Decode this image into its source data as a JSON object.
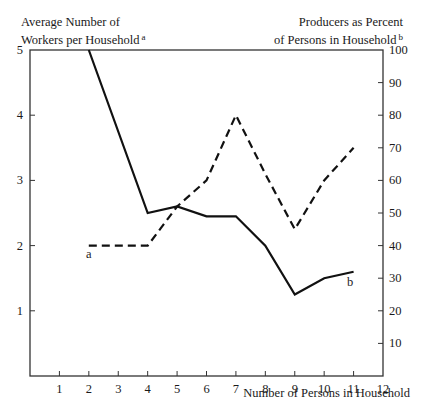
{
  "chart_data": {
    "type": "line",
    "title": "",
    "xlabel": "Number of Persons in Household",
    "ylabel_left": "Average Number of Workers per Household",
    "ylabel_left_footnote": "a",
    "ylabel_right": "Producers as Percent of Persons in Household",
    "ylabel_right_footnote": "b",
    "x_ticks": [
      1,
      2,
      3,
      4,
      5,
      6,
      7,
      8,
      9,
      10,
      11,
      12
    ],
    "y_left_ticks": [
      1,
      2,
      3,
      4,
      5
    ],
    "y_right_ticks": [
      10,
      20,
      30,
      40,
      50,
      60,
      70,
      80,
      90,
      100
    ],
    "xlim": [
      0,
      12
    ],
    "ylim_left": [
      0,
      5
    ],
    "ylim_right": [
      0,
      100
    ],
    "grid": false,
    "legend": "inline labels",
    "series": [
      {
        "name": "a",
        "label": "Average Number of Workers per Household",
        "axis": "left",
        "style": "dashed",
        "x": [
          2,
          4,
          5,
          6,
          7,
          8,
          9,
          10,
          11
        ],
        "values": [
          2.0,
          2.0,
          2.6,
          3.0,
          4.0,
          3.1,
          2.25,
          3.0,
          3.5
        ]
      },
      {
        "name": "b",
        "label": "Producers as Percent of Persons in Household",
        "axis": "right",
        "style": "solid",
        "x": [
          2,
          4,
          5,
          6,
          7,
          8,
          9,
          10,
          11
        ],
        "values": [
          100,
          50,
          52,
          49,
          49,
          40,
          25,
          30,
          32
        ]
      }
    ]
  },
  "labels": {
    "left_title_line1": "Average Number of",
    "left_title_line2": "Workers per Household",
    "left_footnote": "a",
    "right_title_line1": "Producers as Percent",
    "right_title_line2": "of Persons in Household",
    "right_footnote": "b",
    "xlabel": "Number of Persons in Household",
    "series_a_tag": "a",
    "series_b_tag": "b"
  }
}
